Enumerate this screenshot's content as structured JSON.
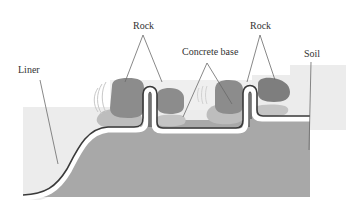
{
  "diagram": {
    "labels": {
      "rock_left": "Rock",
      "rock_right": "Rock",
      "concrete_base": "Concrete base",
      "soil": "Soil",
      "liner": "Liner"
    },
    "colors": {
      "background": "#ffffff",
      "water_zone": "#e9e9e9",
      "soil": "#a8a8a8",
      "rock": "#8f8f8f",
      "concrete_base": "#bdbdbd",
      "liner_dark": "#3a3a3a",
      "liner_light": "#ffffff",
      "leader_line": "#6a6a6a",
      "text": "#333333"
    },
    "elements": [
      {
        "name": "liner",
        "description": "Liner running along soil surface up over two raised ridges"
      },
      {
        "name": "rock",
        "count": 4,
        "description": "Rocks placed on either side of two liner ridges"
      },
      {
        "name": "concrete-base",
        "count": 2,
        "description": "Concrete bases under rocks"
      },
      {
        "name": "soil",
        "description": "Soil layer beneath the liner"
      }
    ]
  }
}
